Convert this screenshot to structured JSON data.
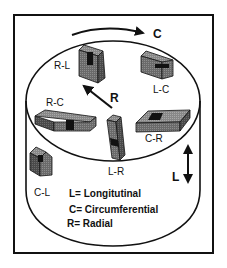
{
  "diagram": {
    "type": "specimen orientation diagram (cylinder)",
    "colors": {
      "stroke": "#111111",
      "block_face": "#6e6e6e",
      "block_top": "#8a8a8a",
      "block_side": "#555555",
      "notch": "#111111",
      "background": "#ffffff"
    },
    "axes": [
      {
        "id": "C",
        "label": "C",
        "meaning": "circumferential arrow (curved, top)"
      },
      {
        "id": "R",
        "label": "R",
        "meaning": "radial arrow (on top face)"
      },
      {
        "id": "L",
        "label": "L",
        "meaning": "longitudinal arrow (double-headed, right side)"
      }
    ],
    "specimens": [
      {
        "id": "R-L",
        "label": "R-L"
      },
      {
        "id": "L-C",
        "label": "L-C"
      },
      {
        "id": "R-C",
        "label": "R-C"
      },
      {
        "id": "L-R",
        "label": "L-R"
      },
      {
        "id": "C-R",
        "label": "C-R"
      },
      {
        "id": "C-L",
        "label": "C-L"
      }
    ],
    "legend": [
      {
        "key": "L",
        "text": "L= Longitutinal"
      },
      {
        "key": "C",
        "text": "C= Circumferential"
      },
      {
        "key": "R",
        "text": "R= Radial"
      }
    ]
  }
}
